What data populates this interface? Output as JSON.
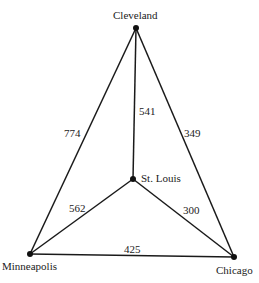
{
  "graph": {
    "nodes": [
      {
        "id": "cleveland",
        "label": "Cleveland",
        "x": 136,
        "y": 28
      },
      {
        "id": "st_louis",
        "label": "St. Louis",
        "x": 133,
        "y": 179
      },
      {
        "id": "minneapolis",
        "label": "Minneapolis",
        "x": 30,
        "y": 254
      },
      {
        "id": "chicago",
        "label": "Chicago",
        "x": 234,
        "y": 257
      }
    ],
    "edges": [
      {
        "from": "cleveland",
        "to": "minneapolis",
        "weight": "774"
      },
      {
        "from": "cleveland",
        "to": "st_louis",
        "weight": "541"
      },
      {
        "from": "cleveland",
        "to": "chicago",
        "weight": "349"
      },
      {
        "from": "st_louis",
        "to": "minneapolis",
        "weight": "562"
      },
      {
        "from": "st_louis",
        "to": "chicago",
        "weight": "300"
      },
      {
        "from": "minneapolis",
        "to": "chicago",
        "weight": "425"
      }
    ]
  }
}
